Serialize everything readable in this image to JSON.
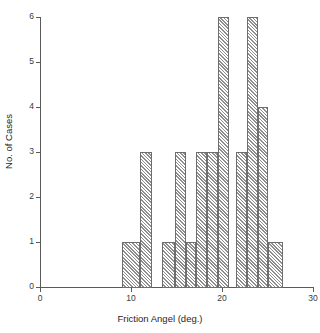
{
  "chart_data": {
    "type": "bar",
    "subtype": "histogram",
    "title": "",
    "xlabel": "Friction Angel (deg.)",
    "ylabel": "No. of Cases",
    "xlim": [
      0,
      30
    ],
    "ylim": [
      0,
      6
    ],
    "grid": false,
    "legend": null,
    "x_ticks": [
      0,
      10,
      20,
      30
    ],
    "x_tick_labels": [
      "0",
      "10",
      "20",
      "30"
    ],
    "y_ticks": [
      0,
      1,
      2,
      3,
      4,
      5,
      6
    ],
    "y_tick_labels": [
      "0",
      "1",
      "2",
      "3",
      "4",
      "5",
      "6"
    ],
    "bin_width": 1.2,
    "bar_fill": "#e9e9e9",
    "bar_edge": "#6e6e6e",
    "bar_hatch": "diagonal-45",
    "bins": [
      {
        "left": 9.0,
        "right": 11.0,
        "count": 1
      },
      {
        "left": 11.0,
        "right": 12.3,
        "count": 3
      },
      {
        "left": 13.4,
        "right": 14.8,
        "count": 1
      },
      {
        "left": 14.8,
        "right": 16.0,
        "count": 3
      },
      {
        "left": 16.0,
        "right": 17.1,
        "count": 1
      },
      {
        "left": 17.1,
        "right": 18.3,
        "count": 3
      },
      {
        "left": 18.3,
        "right": 19.6,
        "count": 3
      },
      {
        "left": 19.6,
        "right": 20.8,
        "count": 6
      },
      {
        "left": 21.5,
        "right": 22.7,
        "count": 3
      },
      {
        "left": 22.7,
        "right": 24.0,
        "count": 6
      },
      {
        "left": 24.0,
        "right": 25.1,
        "count": 4
      },
      {
        "left": 25.1,
        "right": 26.7,
        "count": 1
      }
    ],
    "categories": [
      "9.0-11.0",
      "11.0-12.3",
      "13.4-14.8",
      "14.8-16.0",
      "16.0-17.1",
      "17.1-18.3",
      "18.3-19.6",
      "19.6-20.8",
      "21.5-22.7",
      "22.7-24.0",
      "24.0-25.1",
      "25.1-26.7"
    ],
    "values": [
      1,
      3,
      1,
      3,
      1,
      3,
      3,
      6,
      3,
      6,
      4,
      1
    ],
    "total_cases": 35
  }
}
